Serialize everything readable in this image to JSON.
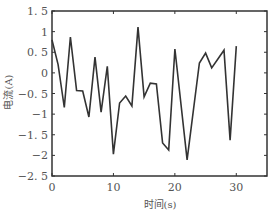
{
  "chart_data": {
    "type": "line",
    "title": "",
    "xlabel": "时间(s)",
    "ylabel": "电流(A)",
    "xlim": [
      0,
      35
    ],
    "ylim": [
      -2.5,
      1.5
    ],
    "grid": false,
    "legend": null,
    "xticks": [
      0,
      10,
      20,
      30
    ],
    "xtick_labels": [
      "0",
      "10",
      "20",
      "30"
    ],
    "yticks": [
      1.5,
      1,
      0.5,
      0,
      -0.5,
      -1,
      -1.5,
      -2,
      -2.5
    ],
    "ytick_labels": [
      "1. 5",
      "1",
      "0. 5",
      "0",
      "−0. 5",
      "−1",
      "−1. 5",
      "−2",
      "−2. 5"
    ],
    "series": [
      {
        "name": "current",
        "color": "#333333",
        "x": [
          0,
          1,
          2,
          3,
          4,
          5,
          6,
          7,
          8,
          9,
          10,
          11,
          12,
          13,
          14,
          15,
          16,
          17,
          18,
          19,
          20,
          22,
          24,
          25,
          26,
          28,
          29,
          30
        ],
        "values": [
          0.8,
          0.2,
          -0.84,
          0.87,
          -0.43,
          -0.44,
          -1.07,
          0.38,
          -0.95,
          0.16,
          -1.97,
          -0.73,
          -0.56,
          -0.8,
          1.11,
          -0.58,
          -0.25,
          -0.27,
          -1.7,
          -1.87,
          0.58,
          -2.11,
          0.24,
          0.48,
          0.12,
          0.55,
          -1.63,
          0.65
        ]
      }
    ]
  },
  "plot_area": {
    "left": 52,
    "top": 11,
    "right": 267,
    "bottom": 176
  }
}
